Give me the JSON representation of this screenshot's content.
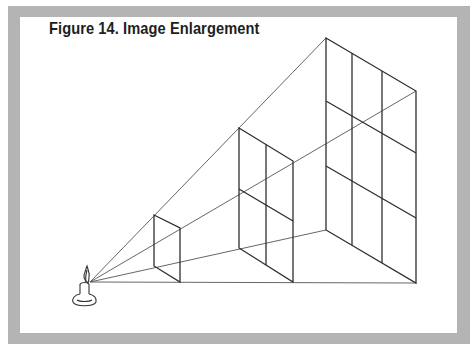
{
  "figure": {
    "title": "Figure 14.  Image Enlargement",
    "border_color": "#b4b4b4",
    "line_color": "#333333"
  },
  "diagram": {
    "source": {
      "label": "candle-light-source",
      "x": 90,
      "y": 282
    },
    "frames": [
      {
        "name": "small-frame",
        "corners": [
          [
            154,
            215
          ],
          [
            180,
            228
          ],
          [
            180,
            282
          ],
          [
            154,
            266
          ]
        ],
        "grid": "1x1"
      },
      {
        "name": "medium-frame",
        "corners": [
          [
            239,
            128
          ],
          [
            293,
            161
          ],
          [
            293,
            282
          ],
          [
            239,
            248
          ]
        ],
        "grid": "2x2"
      },
      {
        "name": "large-frame",
        "corners": [
          [
            326,
            38
          ],
          [
            416,
            91
          ],
          [
            416,
            283
          ],
          [
            326,
            230
          ]
        ],
        "grid": "3x3"
      }
    ]
  }
}
